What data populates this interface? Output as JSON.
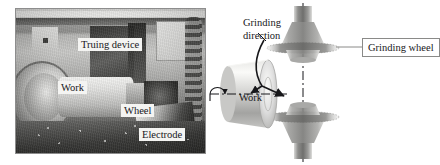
{
  "figure": {
    "panels": [
      {
        "id": "photo",
        "kind": "photograph",
        "caption": ""
      },
      {
        "id": "schematic",
        "kind": "line-diagram",
        "caption": ""
      }
    ]
  },
  "photo": {
    "labels": {
      "truing_device": "Truing device",
      "work": "Work",
      "wheel": "Wheel",
      "electrode": "Electrode"
    }
  },
  "diagram": {
    "labels": {
      "grinding_direction_line1": "Grinding",
      "grinding_direction_line2": "direction",
      "grinding_wheel": "Grinding wheel",
      "work": "Work"
    },
    "elements": {
      "axis": "vertical dash-dot centerline",
      "work_axis": "horizontal dash-dot centerline",
      "rotation_arrow": "work rotation curved arrow",
      "direction_arrow": "curved grinding direction arrow",
      "upper_wheel": "cup-shaped abrasive wheel, tapered, facing down",
      "lower_wheel": "cup-shaped abrasive wheel, tapered, facing up",
      "workpiece": "cylinder shown in perspective"
    },
    "colors": {
      "ink": "#17171a",
      "wheel_gray": "#9b9b99",
      "work_gray": "#c9c9c7",
      "box_border": "#8a8a88",
      "paper": "#ffffff"
    }
  }
}
